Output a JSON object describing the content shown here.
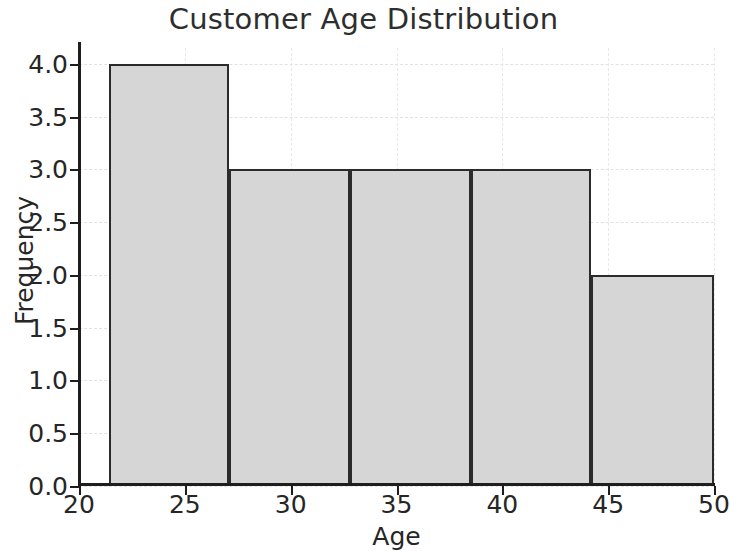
{
  "chart_data": {
    "type": "bar",
    "subtype": "histogram",
    "title": "Customer Age Distribution",
    "xlabel": "Age",
    "ylabel": "Frequency",
    "xlim": [
      20,
      50
    ],
    "ylim": [
      0,
      4.15
    ],
    "xticks": [
      20,
      25,
      30,
      35,
      40,
      45,
      50
    ],
    "xtick_labels": [
      "20",
      "25",
      "30",
      "35",
      "40",
      "45",
      "50"
    ],
    "yticks": [
      0.0,
      0.5,
      1.0,
      1.5,
      2.0,
      2.5,
      3.0,
      3.5,
      4.0
    ],
    "ytick_labels": [
      "0.0",
      "0.5",
      "1.0",
      "1.5",
      "2.0",
      "2.5",
      "3.0",
      "3.5",
      "4.0"
    ],
    "grid": true,
    "grid_style": "dashed",
    "legend": false,
    "bins": [
      {
        "left": 21.4,
        "right": 27.1,
        "value": 4
      },
      {
        "left": 27.1,
        "right": 32.8,
        "value": 3
      },
      {
        "left": 32.8,
        "right": 38.5,
        "value": 3
      },
      {
        "left": 38.5,
        "right": 44.2,
        "value": 3
      },
      {
        "left": 44.2,
        "right": 50.0,
        "value": 2
      }
    ],
    "bin_edges": [
      21.4,
      27.1,
      32.8,
      38.5,
      44.2,
      50.0
    ],
    "values": [
      4,
      3,
      3,
      3,
      2
    ],
    "bar_fill_color": "#d6d6d6",
    "bar_edge_color": "#2b2b2b",
    "title_color": "#2e2e2e",
    "tick_color": "#262626",
    "grid_color": "#e4e4e4",
    "background_color": "#ffffff"
  }
}
